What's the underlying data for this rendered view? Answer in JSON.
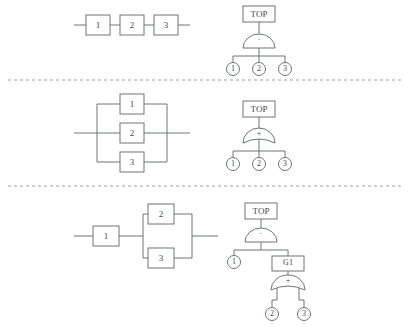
{
  "figure": {
    "background": "#ffffff",
    "line_color": "#6e7378",
    "separator_color": "#9aa0a6",
    "text_color": "#44484c"
  },
  "rows": [
    {
      "name": "series-configuration",
      "block_diagram": {
        "type": "series",
        "blocks": [
          {
            "label": "1"
          },
          {
            "label": "2"
          },
          {
            "label": "3"
          }
        ]
      },
      "fault_tree": {
        "top_label": "TOP",
        "gate_type": "and",
        "gate_symbol": "·",
        "events": [
          {
            "label": "1"
          },
          {
            "label": "2"
          },
          {
            "label": "3"
          }
        ]
      }
    },
    {
      "name": "parallel-configuration",
      "block_diagram": {
        "type": "parallel",
        "blocks": [
          {
            "label": "1"
          },
          {
            "label": "2"
          },
          {
            "label": "3"
          }
        ]
      },
      "fault_tree": {
        "top_label": "TOP",
        "gate_type": "or",
        "gate_symbol": "+",
        "events": [
          {
            "label": "1"
          },
          {
            "label": "2"
          },
          {
            "label": "3"
          }
        ]
      }
    },
    {
      "name": "series-parallel-configuration",
      "block_diagram": {
        "type": "series-parallel",
        "series_block": {
          "label": "1"
        },
        "parallel_blocks": [
          {
            "label": "2"
          },
          {
            "label": "3"
          }
        ]
      },
      "fault_tree": {
        "top_label": "TOP",
        "gate_type": "and",
        "gate_symbol": "·",
        "events": [
          {
            "label": "1"
          }
        ],
        "subgate": {
          "label": "G1",
          "gate_type": "or",
          "gate_symbol": "+",
          "events": [
            {
              "label": "2"
            },
            {
              "label": "3"
            }
          ]
        }
      }
    }
  ]
}
